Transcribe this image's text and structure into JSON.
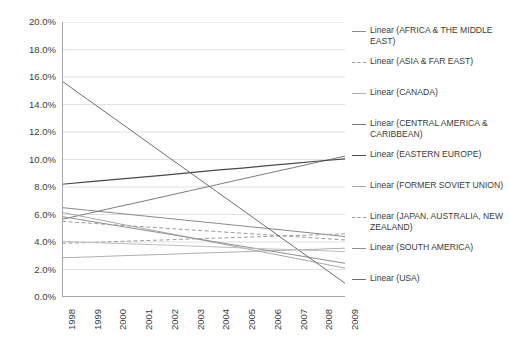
{
  "chart_data": {
    "type": "line",
    "title": "",
    "xlabel": "",
    "ylabel": "",
    "x": [
      1998,
      1999,
      2000,
      2001,
      2002,
      2003,
      2004,
      2005,
      2006,
      2007,
      2008,
      2009
    ],
    "xtick_labels": [
      "1998",
      "1999",
      "2000",
      "2001",
      "2002",
      "2003",
      "2004",
      "2005",
      "2006",
      "2007",
      "2008",
      "2009"
    ],
    "ytick_labels": [
      "0.0%",
      "2.0%",
      "4.0%",
      "6.0%",
      "8.0%",
      "10.0%",
      "12.0%",
      "14.0%",
      "16.0%",
      "18.0%",
      "20.0%"
    ],
    "ytick_values": [
      0,
      2,
      4,
      6,
      8,
      10,
      12,
      14,
      16,
      18,
      20
    ],
    "ylim": [
      0,
      20
    ],
    "xlim": [
      1998,
      2009
    ],
    "grid": "horizontal",
    "legend_position": "right",
    "all_series_are_linear_trendlines": "true",
    "series": [
      {
        "name": "Linear (AFRICA & THE MIDDLE EAST)",
        "color": "#8a8a8a",
        "dash": "solid",
        "width": 1.0,
        "start_value": 6.5,
        "end_value": 4.4,
        "values": [
          6.5,
          6.31,
          6.12,
          5.93,
          5.74,
          5.55,
          5.36,
          5.17,
          4.98,
          4.79,
          4.6,
          4.4
        ]
      },
      {
        "name": "Linear (ASIA & FAR EAST)",
        "color": "#9e9e9e",
        "dash": "dashed",
        "width": 1.0,
        "start_value": 3.9,
        "end_value": 4.6,
        "values": [
          3.9,
          3.96,
          4.03,
          4.09,
          4.15,
          4.22,
          4.28,
          4.34,
          4.41,
          4.47,
          4.53,
          4.6
        ]
      },
      {
        "name": "Linear (CANADA)",
        "color": "#b0b0b0",
        "dash": "solid",
        "width": 1.0,
        "start_value": 2.85,
        "end_value": 3.55,
        "values": [
          2.85,
          2.91,
          2.98,
          3.04,
          3.1,
          3.17,
          3.23,
          3.29,
          3.36,
          3.42,
          3.48,
          3.55
        ]
      },
      {
        "name": "Linear (CENTRAL AMERICA & CARIBBEAN)",
        "color": "#7d7d7d",
        "dash": "solid",
        "width": 1.0,
        "start_value": 5.65,
        "end_value": 10.25,
        "values": [
          5.65,
          6.07,
          6.49,
          6.9,
          7.32,
          7.74,
          8.16,
          8.58,
          9.0,
          9.41,
          9.83,
          10.25
        ]
      },
      {
        "name": "Linear (EASTERN EUROPE)",
        "color": "#4a4a4a",
        "dash": "solid",
        "width": 1.2,
        "start_value": 8.2,
        "end_value": 10.05,
        "values": [
          8.2,
          8.37,
          8.54,
          8.7,
          8.87,
          9.04,
          9.22,
          9.38,
          9.55,
          9.72,
          9.89,
          10.05
        ]
      },
      {
        "name": "Linear (FORMER SOVIET UNION)",
        "color": "#a8a8a8",
        "dash": "solid",
        "width": 1.0,
        "start_value": 6.15,
        "end_value": 2.1,
        "values": [
          6.15,
          5.78,
          5.41,
          5.04,
          4.68,
          4.31,
          3.94,
          3.57,
          3.2,
          2.84,
          2.47,
          2.1
        ]
      },
      {
        "name": "Linear (JAPAN, AUSTRALIA, NEW ZEALAND)",
        "color": "#9c9c9c",
        "dash": "dashed",
        "width": 1.0,
        "start_value": 5.5,
        "end_value": 4.15,
        "values": [
          5.5,
          5.38,
          5.25,
          5.13,
          5.0,
          4.88,
          4.76,
          4.64,
          4.52,
          4.4,
          4.27,
          4.15
        ]
      },
      {
        "name": "Linear (SOUTH AMERICA)",
        "color": "#8f8f8f",
        "dash": "solid",
        "width": 1.0,
        "start_value": 5.85,
        "end_value": 2.45,
        "values": [
          5.85,
          5.54,
          5.23,
          4.92,
          4.62,
          4.31,
          4.0,
          3.69,
          3.38,
          3.07,
          2.76,
          2.45
        ]
      },
      {
        "name": "Linear (USA)",
        "color": "#6e6e6e",
        "dash": "solid",
        "width": 1.0,
        "start_value": 15.7,
        "end_value": 1.0,
        "values": [
          15.7,
          14.36,
          13.03,
          11.69,
          10.35,
          9.02,
          7.68,
          6.35,
          5.01,
          3.67,
          2.34,
          1.0
        ]
      },
      {
        "name": "Linear (WESTERN EUROPE)",
        "color": "#bdbdbd",
        "dash": "solid",
        "width": 1.0,
        "start_value": 4.05,
        "end_value": 3.3,
        "values": [
          4.05,
          3.98,
          3.91,
          3.84,
          3.78,
          3.71,
          3.64,
          3.57,
          3.5,
          3.44,
          3.37,
          3.3
        ]
      }
    ]
  },
  "legend": {
    "items": [
      {
        "label": "Linear (AFRICA & THE MIDDLE EAST)",
        "color": "#8a8a8a",
        "dash": "solid"
      },
      {
        "label": "Linear (ASIA & FAR EAST)",
        "color": "#9e9e9e",
        "dash": "dashed"
      },
      {
        "label": "Linear (CANADA)",
        "color": "#b0b0b0",
        "dash": "solid"
      },
      {
        "label": "Linear (CENTRAL AMERICA & CARIBBEAN)",
        "color": "#7d7d7d",
        "dash": "solid"
      },
      {
        "label": "Linear (EASTERN EUROPE)",
        "color": "#4a4a4a",
        "dash": "solid"
      },
      {
        "label": "Linear (FORMER SOVIET UNION)",
        "color": "#a8a8a8",
        "dash": "solid"
      },
      {
        "label": "Linear (JAPAN, AUSTRALIA, NEW ZEALAND)",
        "color": "#9c9c9c",
        "dash": "dashed"
      },
      {
        "label": "Linear (SOUTH AMERICA)",
        "color": "#8f8f8f",
        "dash": "solid"
      },
      {
        "label": "Linear (USA)",
        "color": "#6e6e6e",
        "dash": "solid"
      }
    ]
  },
  "colors": {
    "axis": "#a6a6a6",
    "grid": "#d9d9d9",
    "text": "#3b3b3b",
    "background": "#ffffff"
  }
}
